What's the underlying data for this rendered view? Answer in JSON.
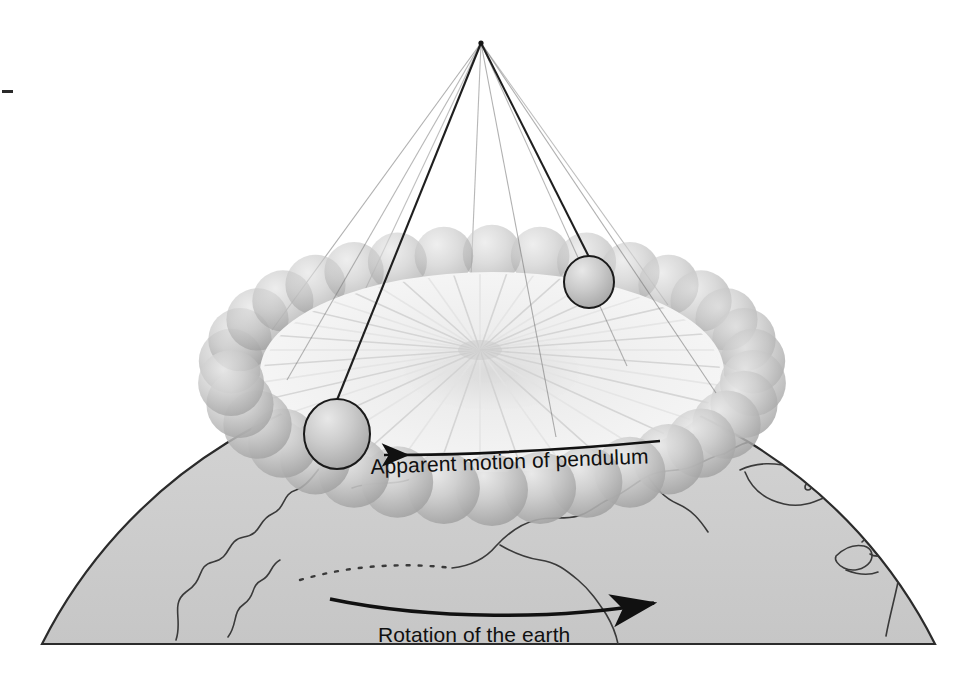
{
  "figure": {
    "background_color": "#ffffff"
  },
  "labels": {
    "apparent_motion": "Apparent motion of pendulum",
    "rotation": "Rotation of the earth"
  },
  "colors": {
    "line": "#1a1a1a",
    "earth_fill": "#cfcfcf",
    "earth_outline": "#2b2b2b",
    "coastline": "#3a3a3a",
    "sphere_light": "#e2e2e2",
    "sphere_mid": "#c3c3c3",
    "sphere_dark": "#a6a6a6",
    "fan_light": "#f2f2f2",
    "fan_mid": "#dcdcdc",
    "bob_outline": "#1a1a1a",
    "wire_bold": "#1f1f1f",
    "wire_faint": "#6f6f6f"
  },
  "pendulum": {
    "pivot": {
      "x": 481,
      "y": 43
    },
    "ring": {
      "center_x": 492,
      "center_y": 372,
      "radius_x": 262,
      "radius_y": 118,
      "ghost_sphere_count": 34,
      "ghost_sphere_radius": 34
    },
    "bobs": [
      {
        "name": "bob-left",
        "cx": 337,
        "cy": 434,
        "rx": 33,
        "ry": 35
      },
      {
        "name": "bob-right",
        "cx": 589,
        "cy": 282,
        "rx": 25,
        "ry": 26
      }
    ],
    "wires_bold": [
      {
        "x1": 481,
        "y1": 43,
        "x2": 337,
        "y2": 400
      },
      {
        "x1": 481,
        "y1": 43,
        "x2": 589,
        "y2": 257
      }
    ],
    "wires_faint": [
      {
        "x1": 481,
        "y1": 43,
        "x2": 272,
        "y2": 330,
        "opacity": 0.55
      },
      {
        "x1": 481,
        "y1": 43,
        "x2": 287,
        "y2": 380,
        "opacity": 0.5
      },
      {
        "x1": 481,
        "y1": 43,
        "x2": 365,
        "y2": 290,
        "opacity": 0.45
      },
      {
        "x1": 481,
        "y1": 43,
        "x2": 470,
        "y2": 300,
        "opacity": 0.5
      },
      {
        "x1": 481,
        "y1": 43,
        "x2": 556,
        "y2": 437,
        "opacity": 0.55
      },
      {
        "x1": 481,
        "y1": 43,
        "x2": 627,
        "y2": 366,
        "opacity": 0.5
      },
      {
        "x1": 481,
        "y1": 43,
        "x2": 668,
        "y2": 305,
        "opacity": 0.45
      },
      {
        "x1": 481,
        "y1": 43,
        "x2": 716,
        "y2": 393,
        "opacity": 0.55
      }
    ],
    "swing_fan": {
      "center_x": 480,
      "center_y": 350,
      "ray_count": 40,
      "description": "radial fan of swept swing planes inside the ring"
    }
  },
  "earth": {
    "dome": {
      "left_x": 42,
      "right_x": 935,
      "baseline_y": 644,
      "apex_y": 405
    },
    "regions": [
      "Siberia",
      "Alaska",
      "Aleutian Islands",
      "Canada",
      "Greenland",
      "Hudson Bay",
      "Great Lakes"
    ]
  },
  "arrows": {
    "apparent_motion": {
      "direction": "left",
      "start": {
        "x": 660,
        "y": 441
      },
      "end": {
        "x": 378,
        "y": 456
      }
    },
    "rotation": {
      "direction": "right",
      "start": {
        "x": 330,
        "y": 599
      },
      "end": {
        "x": 660,
        "y": 604
      }
    }
  },
  "marks": {
    "registration_tick": {
      "x": 2,
      "y": 90,
      "width": 11,
      "height": 3
    }
  }
}
